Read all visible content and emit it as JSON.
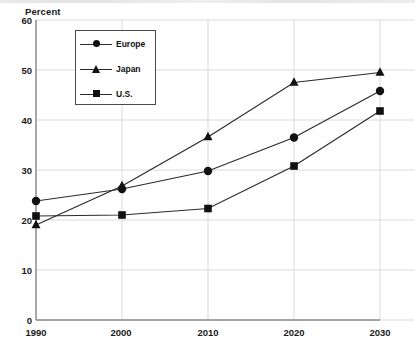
{
  "chart_data": {
    "type": "line",
    "title": "",
    "xlabel": "",
    "ylabel": "Percent",
    "categories": [
      "1990",
      "2000",
      "2010",
      "2020",
      "2030"
    ],
    "x": [
      1990,
      2000,
      2010,
      2020,
      2030
    ],
    "xlim": [
      1990,
      2030
    ],
    "ylim": [
      0,
      60
    ],
    "yticks": [
      0,
      10,
      20,
      30,
      40,
      50,
      60
    ],
    "ytick_labels": [
      "0",
      "10",
      "20",
      "30",
      "40",
      "50",
      "60"
    ],
    "grid": true,
    "legend_position": "upper-left-inside",
    "series": [
      {
        "name": "Europe",
        "marker": "circle",
        "color": "#111111",
        "values": [
          23.8,
          26.2,
          29.8,
          36.5,
          45.8
        ]
      },
      {
        "name": "Japan",
        "marker": "triangle",
        "color": "#111111",
        "values": [
          19.0,
          26.8,
          36.6,
          47.5,
          49.5
        ]
      },
      {
        "name": "U.S.",
        "marker": "square",
        "color": "#111111",
        "values": [
          20.8,
          21.0,
          22.3,
          30.8,
          41.8
        ]
      }
    ]
  },
  "axis": {
    "y_title": "Percent",
    "y_labels": [
      "60",
      "50",
      "40",
      "30",
      "20",
      "10",
      "0"
    ],
    "x_labels": [
      "1990",
      "2000",
      "2010",
      "2020",
      "2030"
    ]
  },
  "legend": {
    "items": [
      {
        "label": "Europe",
        "marker": "circle-marker"
      },
      {
        "label": "Japan",
        "marker": "triangle-marker"
      },
      {
        "label": "U.S.",
        "marker": "square-marker"
      }
    ]
  },
  "colors": {
    "ink": "#111111",
    "axis": "#8c8c8c",
    "grid": "#d9d9d9",
    "series_line": "#2b2b2b",
    "background": "#ffffff"
  }
}
